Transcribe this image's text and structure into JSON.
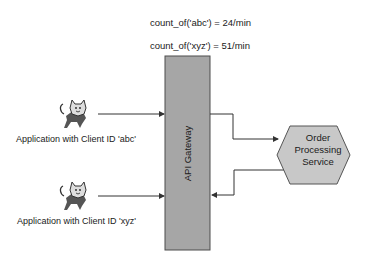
{
  "metrics": {
    "abc": "count_of('abc') = 24/min",
    "xyz": "count_of('xyz') = 51/min"
  },
  "clients": [
    {
      "label": "Application with Client ID 'abc'",
      "icon": "tomcat-cat-icon"
    },
    {
      "label": "Application with Client ID 'xyz'",
      "icon": "tomcat-cat-icon"
    }
  ],
  "gateway": {
    "label": "API Gateway",
    "fill": "#a6a6a6",
    "stroke": "#4d4d4d"
  },
  "service": {
    "label_lines": [
      "Order",
      "Processing",
      "Service"
    ],
    "fill": "#c8c8c8",
    "stroke": "#555555"
  },
  "colors": {
    "line": "#333333",
    "text": "#1a1a1a"
  }
}
